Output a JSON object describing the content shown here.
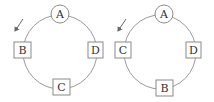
{
  "diagrams": [
    {
      "name": "left-cycle",
      "ring": {
        "cx": 58,
        "cy": 52,
        "r": 38
      },
      "nodes": [
        {
          "label": "A",
          "shape": "circle",
          "x": 60,
          "y": 14
        },
        {
          "label": "B",
          "shape": "box",
          "x": 22,
          "y": 50
        },
        {
          "label": "D",
          "shape": "box",
          "x": 95,
          "y": 50
        },
        {
          "label": "C",
          "shape": "box",
          "x": 61,
          "y": 87
        }
      ],
      "arrow": {
        "x1": 23,
        "y1": 19,
        "x2": 15,
        "y2": 31,
        "direction": "counterclockwise"
      }
    },
    {
      "name": "right-cycle",
      "ring": {
        "cx": 158,
        "cy": 52,
        "r": 38
      },
      "nodes": [
        {
          "label": "A",
          "shape": "circle",
          "x": 164,
          "y": 14
        },
        {
          "label": "C",
          "shape": "box",
          "x": 123,
          "y": 50
        },
        {
          "label": "D",
          "shape": "box",
          "x": 193,
          "y": 50
        },
        {
          "label": "B",
          "shape": "box",
          "x": 164,
          "y": 88
        }
      ],
      "arrow": {
        "x1": 126,
        "y1": 19,
        "x2": 118,
        "y2": 31,
        "direction": "counterclockwise"
      }
    }
  ],
  "colors": {
    "stroke": "#8a8a8a",
    "text": "#333333",
    "background": "#ffffff"
  }
}
